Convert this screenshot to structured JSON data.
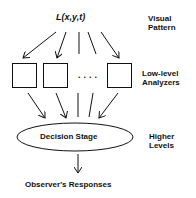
{
  "diagram": {
    "input": {
      "formula": "L(x,y,t)"
    },
    "analyzers": {
      "ellipsis": "...."
    },
    "decision": {
      "label": "Decision Stage"
    },
    "output": {
      "label": "Observer's Responses"
    },
    "side_labels": {
      "visual_pattern": [
        "Visual",
        "Pattern"
      ],
      "low_level": [
        "Low-level",
        "Analyzers"
      ],
      "higher": [
        "Higher",
        "Levels"
      ]
    }
  }
}
